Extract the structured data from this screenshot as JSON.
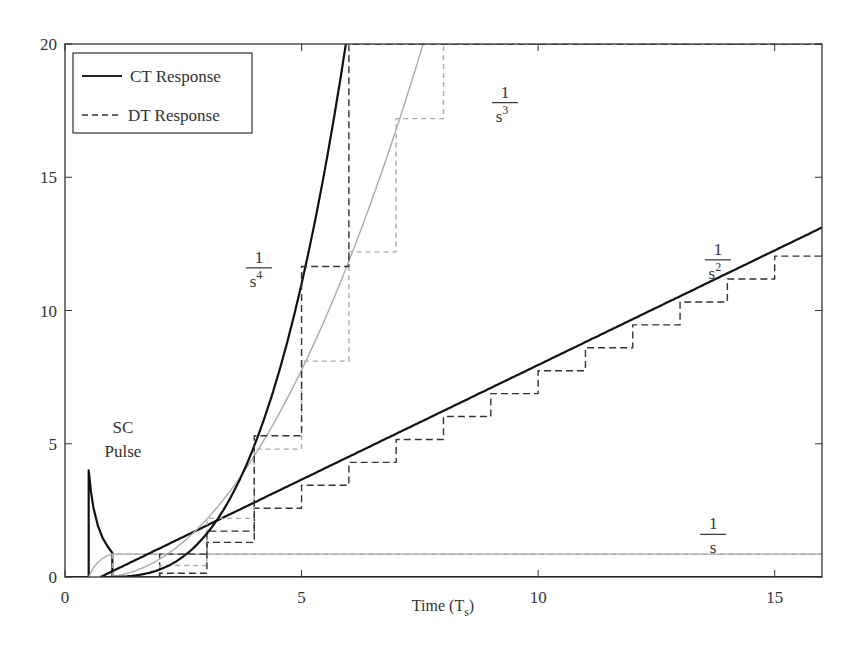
{
  "chart_data": {
    "type": "line",
    "title": "",
    "xlabel": "Time (T_s)",
    "xlabel_main": "Time (T",
    "xlabel_sub": "s",
    "xlabel_close": ")",
    "ylabel": "",
    "xlim": [
      0,
      16
    ],
    "ylim": [
      0,
      20
    ],
    "grid": false,
    "xticks": [
      0,
      5,
      10,
      15
    ],
    "yticks": [
      0,
      5,
      10,
      15,
      20
    ],
    "legend": {
      "position": "upper-left",
      "entries": [
        {
          "label": "CT Response",
          "style": "solid"
        },
        {
          "label": "DT Response",
          "style": "dashed"
        }
      ]
    },
    "annotations": [
      {
        "text_line1": "SC",
        "text_line2": "Pulse",
        "x": 1.0,
        "y": 5.2
      },
      {
        "numerator": "1",
        "denominator": "s",
        "exponent": "",
        "x": 13.7,
        "y": 1.6
      },
      {
        "numerator": "1",
        "denominator": "s",
        "exponent": "2",
        "x": 13.8,
        "y": 11.9
      },
      {
        "numerator": "1",
        "denominator": "s",
        "exponent": "3",
        "x": 9.3,
        "y": 17.8
      },
      {
        "numerator": "1",
        "denominator": "s",
        "exponent": "4",
        "x": 4.1,
        "y": 11.6
      }
    ],
    "series": [
      {
        "name": "SC Pulse (CT)",
        "style": "solid",
        "color": "#111111",
        "x": [
          0,
          0.5,
          0.5,
          0.55,
          0.6,
          0.7,
          0.8,
          0.9,
          1.0,
          1.0,
          16
        ],
        "y": [
          0,
          0,
          4.0,
          3.2,
          2.6,
          1.9,
          1.45,
          1.15,
          0.9,
          0,
          0
        ]
      },
      {
        "name": "1/s CT",
        "style": "solid",
        "color": "#aaaaaa",
        "x": [
          0.5,
          0.6,
          0.7,
          0.8,
          0.9,
          1.0,
          1.2,
          16
        ],
        "y": [
          0,
          0.35,
          0.55,
          0.7,
          0.8,
          0.86,
          0.86,
          0.86
        ]
      },
      {
        "name": "1/s DT",
        "style": "dashed",
        "color": "#aaaaaa",
        "x": [
          1,
          1,
          16
        ],
        "y": [
          0,
          0.86,
          0.86
        ]
      },
      {
        "name": "1/s^2 CT",
        "style": "solid",
        "color": "#111111",
        "slope": 0.86,
        "t0": 0.75,
        "x": [
          0.75,
          16
        ],
        "y": [
          0,
          13.1
        ]
      },
      {
        "name": "1/s^2 DT",
        "style": "dashed",
        "color": "#333333",
        "step_times": [
          1,
          2,
          3,
          4,
          5,
          6,
          7,
          8,
          9,
          10,
          11,
          12,
          13,
          14,
          15
        ],
        "step_values": [
          0,
          0.86,
          1.72,
          2.58,
          3.44,
          4.3,
          5.16,
          6.02,
          6.88,
          7.74,
          8.6,
          9.46,
          10.32,
          11.18,
          12.04
        ]
      },
      {
        "name": "1/s^3 CT",
        "style": "solid",
        "color": "#aaaaaa",
        "t0": 0.75,
        "x": [
          0.75,
          2,
          3,
          4,
          5,
          6,
          7,
          7.5
        ],
        "y": [
          0,
          0.67,
          2.18,
          4.54,
          7.77,
          11.85,
          16.8,
          19.6
        ]
      },
      {
        "name": "1/s^3 DT",
        "style": "dashed",
        "color": "#aaaaaa",
        "step_times": [
          2,
          3,
          4,
          5,
          6,
          7,
          8
        ],
        "step_values": [
          0.43,
          2.2,
          4.8,
          8.1,
          12.2,
          17.2,
          20
        ]
      },
      {
        "name": "1/s^4 CT",
        "style": "solid",
        "color": "#111111",
        "t0": 0.75,
        "x": [
          0.75,
          2,
          3,
          4,
          5,
          5.5,
          5.95
        ],
        "y": [
          0,
          0.28,
          1.63,
          4.92,
          11.0,
          15.4,
          20
        ]
      },
      {
        "name": "1/s^4 DT",
        "style": "dashed",
        "color": "#333333",
        "step_times": [
          2,
          3,
          4,
          5,
          6
        ],
        "step_values": [
          0.14,
          1.3,
          5.3,
          11.65,
          20
        ]
      }
    ]
  }
}
